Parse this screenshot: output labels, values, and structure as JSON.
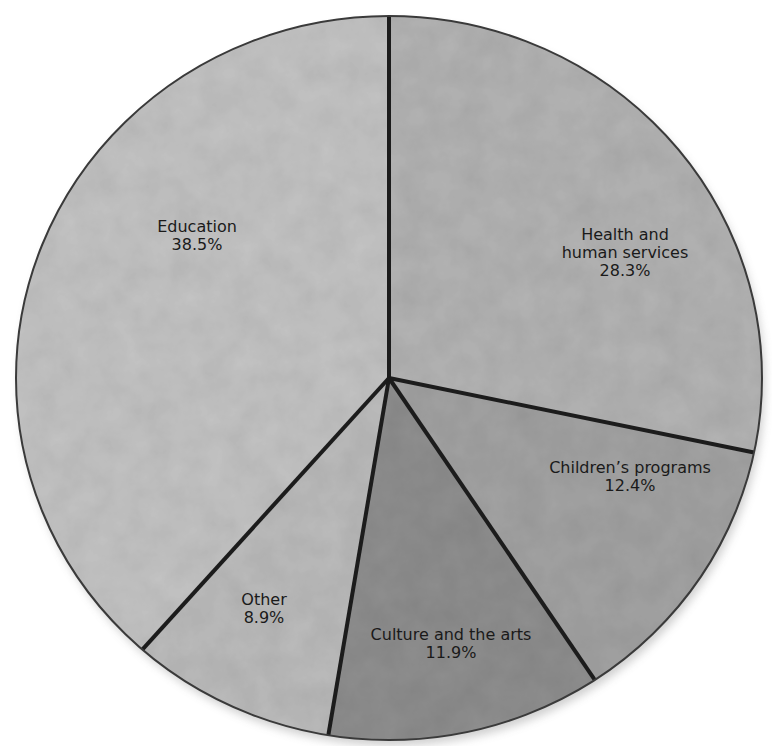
{
  "chart_data": {
    "type": "pie",
    "title": "",
    "start_angle_deg": 0,
    "direction": "clockwise",
    "slices": [
      {
        "label": "Health and human services",
        "label_lines": [
          "Health and",
          "human services"
        ],
        "value": 28.3,
        "value_text": "28.3%",
        "color": "#b4b4b4",
        "label_pos": [
          625,
          240
        ]
      },
      {
        "label": "Children's programs",
        "label_lines": [
          "Children’s programs"
        ],
        "value": 12.4,
        "value_text": "12.4%",
        "color": "#a3a3a3",
        "label_pos": [
          630,
          473
        ]
      },
      {
        "label": "Culture and the arts",
        "label_lines": [
          "Culture and the arts"
        ],
        "value": 11.9,
        "value_text": "11.9%",
        "color": "#8f8f8f",
        "label_pos": [
          451,
          640
        ]
      },
      {
        "label": "Other",
        "label_lines": [
          "Other"
        ],
        "value": 8.9,
        "value_text": "8.9%",
        "color": "#bcbcbc",
        "label_pos": [
          264,
          605
        ]
      },
      {
        "label": "Education",
        "label_lines": [
          "Education"
        ],
        "value": 38.5,
        "value_text": "38.5%",
        "color": "#c4c4c4",
        "label_pos": [
          197,
          232
        ]
      }
    ],
    "geometry": {
      "cx": 389,
      "cy": 378,
      "rx": 373,
      "ry": 362
    }
  }
}
